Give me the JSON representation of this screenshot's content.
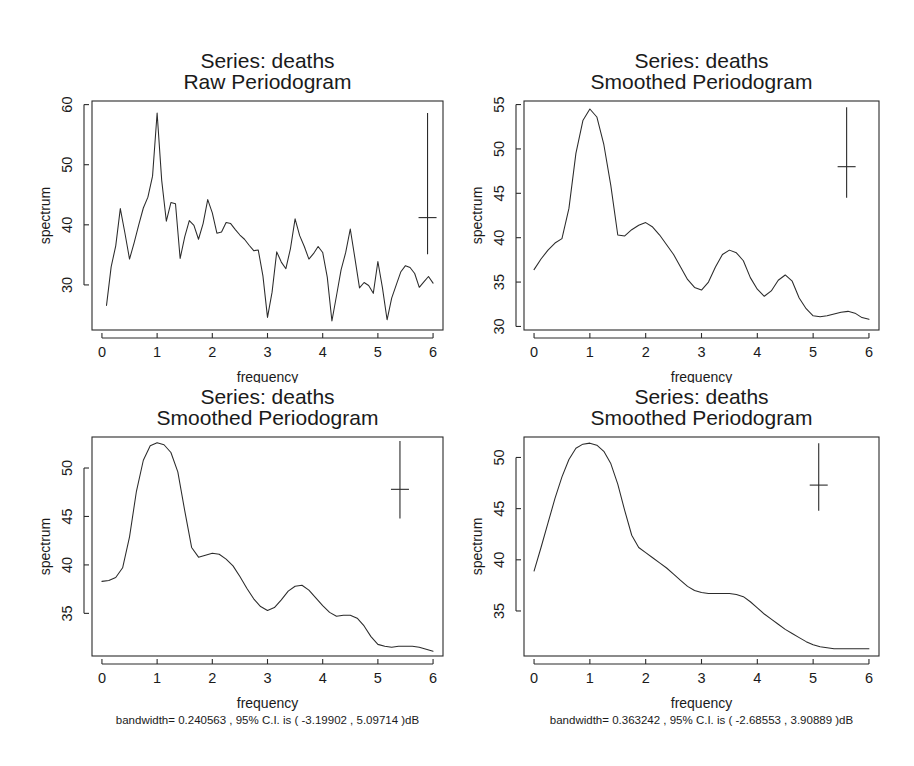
{
  "figure": {
    "width": 914,
    "height": 766,
    "background": "#ffffff",
    "foreground": "#1a1a1a",
    "layout": "2x2 grid of spectral density plots"
  },
  "chart_data": [
    {
      "id": "panel-top-left",
      "type": "line",
      "title": "Series:  deaths",
      "subtitle": "Raw Periodogram",
      "xlabel": "frequency",
      "ylabel": "spectrum",
      "caption": "bandwidth= 0.0481124 , 95% C.I. is ( -5.87588 , 17.5667 )dB",
      "bandwidth": 0.0481124,
      "ci_low_dB": -5.87588,
      "ci_high_dB": 17.5667,
      "grid": false,
      "legend": "none",
      "xlim": [
        -0.18,
        6.18
      ],
      "ylim": [
        22.5,
        60.6
      ],
      "xticks": [
        0,
        1,
        2,
        3,
        4,
        5,
        6
      ],
      "yticks": [
        30,
        40,
        50,
        60
      ],
      "ci_marker": {
        "x": 5.9,
        "center": 41.2,
        "low": 35.1,
        "high": 58.6
      },
      "x": [
        0.083,
        0.167,
        0.25,
        0.333,
        0.417,
        0.5,
        0.583,
        0.667,
        0.75,
        0.833,
        0.917,
        1.0,
        1.083,
        1.167,
        1.25,
        1.333,
        1.417,
        1.5,
        1.583,
        1.667,
        1.75,
        1.833,
        1.917,
        2.0,
        2.083,
        2.167,
        2.25,
        2.333,
        2.417,
        2.5,
        2.583,
        2.667,
        2.75,
        2.833,
        2.917,
        3.0,
        3.083,
        3.167,
        3.25,
        3.333,
        3.417,
        3.5,
        3.583,
        3.667,
        3.75,
        3.833,
        3.917,
        4.0,
        4.083,
        4.167,
        4.25,
        4.333,
        4.417,
        4.5,
        4.583,
        4.667,
        4.75,
        4.833,
        4.917,
        5.0,
        5.083,
        5.167,
        5.25,
        5.333,
        5.417,
        5.5,
        5.583,
        5.667,
        5.75,
        5.833,
        5.917,
        6.0
      ],
      "y": [
        26.6,
        33.0,
        36.5,
        42.7,
        38.6,
        34.3,
        37.0,
        40.0,
        42.8,
        44.6,
        48.1,
        58.6,
        47.4,
        40.6,
        43.7,
        43.5,
        34.4,
        38.0,
        40.7,
        39.9,
        37.6,
        40.2,
        44.2,
        42.0,
        38.6,
        38.8,
        40.4,
        40.2,
        39.2,
        38.3,
        37.6,
        36.6,
        35.7,
        35.8,
        31.5,
        24.6,
        28.8,
        35.5,
        33.8,
        32.7,
        36.1,
        41.0,
        38.2,
        36.4,
        34.3,
        35.2,
        36.4,
        35.4,
        31.3,
        24.0,
        28.2,
        32.5,
        35.4,
        39.3,
        34.5,
        29.5,
        30.4,
        29.9,
        28.6,
        33.9,
        29.5,
        24.2,
        27.8,
        30.0,
        32.2,
        33.2,
        32.9,
        31.9,
        29.6,
        30.5,
        31.4,
        30.3
      ]
    },
    {
      "id": "panel-top-right",
      "type": "line",
      "title": "Series:  deaths",
      "subtitle": "Smoothed Periodogram",
      "xlabel": "frequency",
      "ylabel": "spectrum",
      "caption": "bandwidth= 0.173472 , 95% C.I. is ( -3.68829 , 6.45504 )dB",
      "bandwidth": 0.173472,
      "ci_low_dB": -3.68829,
      "ci_high_dB": 6.45504,
      "grid": false,
      "legend": "none",
      "xlim": [
        -0.18,
        6.18
      ],
      "ylim": [
        29.6,
        55.4
      ],
      "xticks": [
        0,
        1,
        2,
        3,
        4,
        5,
        6
      ],
      "yticks": [
        30,
        35,
        40,
        45,
        50,
        55
      ],
      "ci_marker": {
        "x": 5.6,
        "center": 48.0,
        "low": 44.5,
        "high": 54.7
      },
      "x": [
        0.0,
        0.125,
        0.25,
        0.375,
        0.5,
        0.625,
        0.75,
        0.875,
        1.0,
        1.125,
        1.25,
        1.375,
        1.5,
        1.625,
        1.75,
        1.875,
        2.0,
        2.125,
        2.25,
        2.375,
        2.5,
        2.625,
        2.75,
        2.875,
        3.0,
        3.125,
        3.25,
        3.375,
        3.5,
        3.625,
        3.75,
        3.875,
        4.0,
        4.125,
        4.25,
        4.375,
        4.5,
        4.625,
        4.75,
        4.875,
        5.0,
        5.125,
        5.25,
        5.375,
        5.5,
        5.625,
        5.75,
        5.875,
        6.0
      ],
      "y": [
        36.4,
        37.6,
        38.6,
        39.4,
        39.9,
        43.3,
        49.5,
        53.2,
        54.5,
        53.6,
        50.5,
        45.9,
        40.3,
        40.2,
        40.9,
        41.4,
        41.7,
        41.2,
        40.3,
        39.2,
        38.1,
        36.7,
        35.3,
        34.4,
        34.1,
        35.0,
        36.7,
        38.1,
        38.6,
        38.3,
        37.4,
        35.5,
        34.2,
        33.4,
        34.0,
        35.2,
        35.8,
        35.1,
        33.2,
        32.0,
        31.2,
        31.1,
        31.2,
        31.4,
        31.6,
        31.7,
        31.5,
        31.0,
        30.8
      ]
    },
    {
      "id": "panel-bottom-left",
      "type": "line",
      "title": "Series:  deaths",
      "subtitle": "Smoothed Periodogram",
      "xlabel": "frequency",
      "ylabel": "spectrum",
      "caption": "bandwidth= 0.240563 , 95% C.I. is ( -3.19902 , 5.09714 )dB",
      "bandwidth": 0.240563,
      "ci_low_dB": -3.19902,
      "ci_high_dB": 5.09714,
      "grid": false,
      "legend": "none",
      "xlim": [
        -0.18,
        6.18
      ],
      "ylim": [
        30.6,
        53.2
      ],
      "xticks": [
        0,
        1,
        2,
        3,
        4,
        5,
        6
      ],
      "yticks": [
        35,
        40,
        45,
        50
      ],
      "ci_marker": {
        "x": 5.4,
        "center": 47.8,
        "low": 44.8,
        "high": 52.8
      },
      "x": [
        0.0,
        0.125,
        0.25,
        0.375,
        0.5,
        0.625,
        0.75,
        0.875,
        1.0,
        1.125,
        1.25,
        1.375,
        1.5,
        1.625,
        1.75,
        1.875,
        2.0,
        2.125,
        2.25,
        2.375,
        2.5,
        2.625,
        2.75,
        2.875,
        3.0,
        3.125,
        3.25,
        3.375,
        3.5,
        3.625,
        3.75,
        3.875,
        4.0,
        4.125,
        4.25,
        4.375,
        4.5,
        4.625,
        4.75,
        4.875,
        5.0,
        5.125,
        5.25,
        5.375,
        5.5,
        5.625,
        5.75,
        5.875,
        6.0
      ],
      "y": [
        38.3,
        38.4,
        38.7,
        39.7,
        42.9,
        47.6,
        50.8,
        52.3,
        52.6,
        52.4,
        51.6,
        49.6,
        45.6,
        41.8,
        40.8,
        41.0,
        41.2,
        41.1,
        40.6,
        39.9,
        38.8,
        37.6,
        36.5,
        35.7,
        35.3,
        35.6,
        36.4,
        37.3,
        37.8,
        37.9,
        37.4,
        36.6,
        35.8,
        35.1,
        34.7,
        34.8,
        34.8,
        34.5,
        33.7,
        32.6,
        31.8,
        31.6,
        31.5,
        31.6,
        31.6,
        31.6,
        31.5,
        31.3,
        31.1
      ]
    },
    {
      "id": "panel-bottom-right",
      "type": "line",
      "title": "Series:  deaths",
      "subtitle": "Smoothed Periodogram",
      "xlabel": "frequency",
      "ylabel": "spectrum",
      "caption": "bandwidth= 0.363242 , 95% C.I. is ( -2.68553 , 3.90889 )dB",
      "bandwidth": 0.363242,
      "ci_low_dB": -2.68553,
      "ci_high_dB": 3.90889,
      "grid": false,
      "legend": "none",
      "xlim": [
        -0.18,
        6.18
      ],
      "ylim": [
        30.6,
        52.0
      ],
      "xticks": [
        0,
        1,
        2,
        3,
        4,
        5,
        6
      ],
      "yticks": [
        35,
        40,
        45,
        50
      ],
      "ci_marker": {
        "x": 5.1,
        "center": 47.3,
        "low": 44.8,
        "high": 51.4
      },
      "x": [
        0.0,
        0.125,
        0.25,
        0.375,
        0.5,
        0.625,
        0.75,
        0.875,
        1.0,
        1.125,
        1.25,
        1.375,
        1.5,
        1.625,
        1.75,
        1.875,
        2.0,
        2.125,
        2.25,
        2.375,
        2.5,
        2.625,
        2.75,
        2.875,
        3.0,
        3.125,
        3.25,
        3.375,
        3.5,
        3.625,
        3.75,
        3.875,
        4.0,
        4.125,
        4.25,
        4.375,
        4.5,
        4.625,
        4.75,
        4.875,
        5.0,
        5.125,
        5.25,
        5.375,
        5.5,
        5.625,
        5.75,
        5.875,
        6.0
      ],
      "y": [
        38.9,
        41.2,
        43.6,
        46.0,
        48.1,
        49.8,
        50.9,
        51.3,
        51.4,
        51.2,
        50.6,
        49.4,
        47.4,
        44.8,
        42.4,
        41.2,
        40.7,
        40.2,
        39.7,
        39.2,
        38.6,
        38.0,
        37.4,
        37.0,
        36.8,
        36.7,
        36.7,
        36.7,
        36.7,
        36.6,
        36.4,
        35.9,
        35.3,
        34.7,
        34.2,
        33.7,
        33.2,
        32.8,
        32.4,
        32.0,
        31.7,
        31.5,
        31.4,
        31.3,
        31.3,
        31.3,
        31.3,
        31.3,
        31.3
      ]
    }
  ]
}
